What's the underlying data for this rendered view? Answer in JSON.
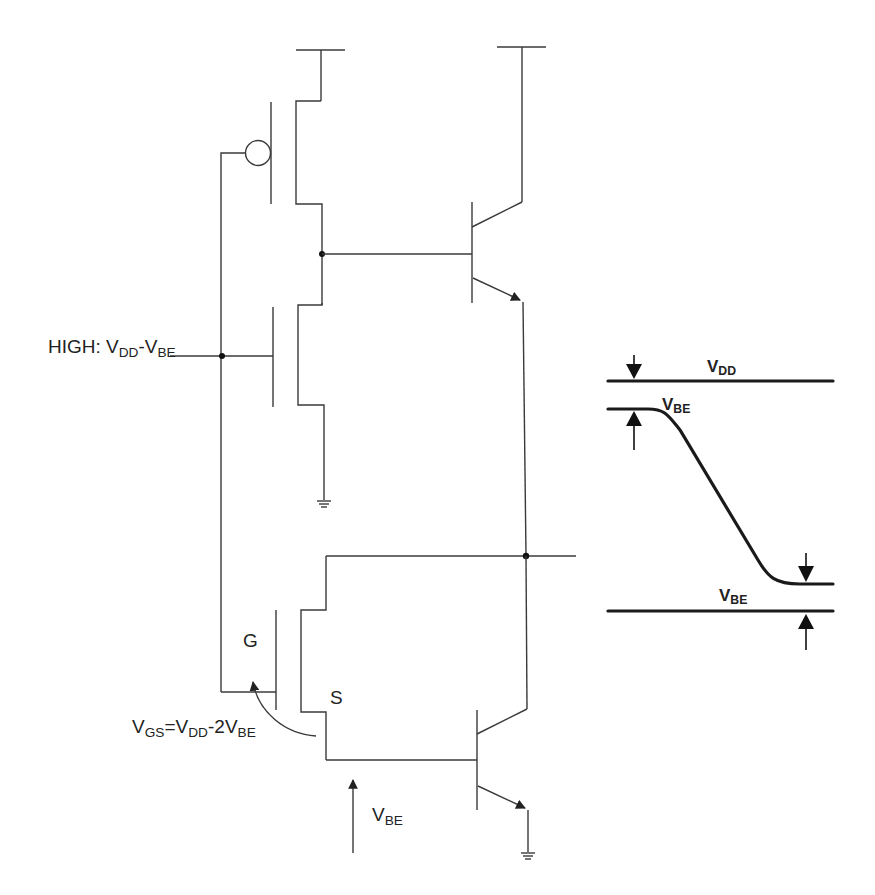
{
  "diagram": {
    "type": "BiCMOS inverter circuit with output voltage swing waveform",
    "circuit": {
      "input_label": {
        "prefix": "HIGH: V",
        "sub1": "DD",
        "mid": "-V",
        "sub2": "BE"
      },
      "gate_label": "G",
      "source_label": "S",
      "vgs_label": {
        "v1": "V",
        "s1": "GS",
        "eq": "=V",
        "s2": "DD",
        "mid": "-2V",
        "s3": "BE"
      },
      "vbe_label": {
        "v": "V",
        "sub": "BE"
      },
      "components": [
        "PMOS (top)",
        "NMOS (middle)",
        "NMOS (bottom)",
        "NPN BJT (top)",
        "NPN BJT (bottom)",
        "ground x2",
        "supply rails x2"
      ]
    },
    "waveform": {
      "top_rail_label": {
        "v": "V",
        "sub": "DD"
      },
      "upper_gap_label": {
        "v": "V",
        "sub": "BE"
      },
      "bottom_rail_label": {
        "v": "V",
        "sub": "BE"
      },
      "description": "Output swings from VDD - VBE down to VBE"
    },
    "colors": {
      "line": "#3a3a3a",
      "thick": "#1a1a1a",
      "background": "#ffffff"
    }
  }
}
